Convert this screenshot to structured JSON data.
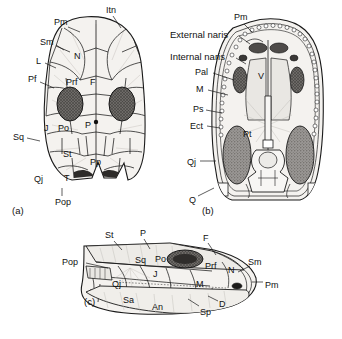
{
  "figure": {
    "background": "#ffffff",
    "ink": "#1a1a1a",
    "bone_fill": "#f2f0ec",
    "orbit_fill": "#6b6b6b",
    "vacuity_fill": "#8d8a86",
    "tooth_fill": "#ffffff"
  },
  "panels": [
    {
      "caption": "(a)",
      "view": "dorsal skull roof",
      "labels": [
        {
          "text": "Itn",
          "x": 106,
          "y": 6,
          "leader": [
            [
              113,
              16
            ],
            [
              121,
              28
            ]
          ]
        },
        {
          "text": "Pm",
          "x": 54,
          "y": 18,
          "leader": [
            [
              68,
              27
            ],
            [
              80,
              32
            ]
          ]
        },
        {
          "text": "Sm",
          "x": 40,
          "y": 38,
          "leader": [
            [
              56,
              45
            ],
            [
              64,
              50
            ]
          ]
        },
        {
          "text": "L",
          "x": 36,
          "y": 57,
          "leader": [
            [
              45,
              63
            ],
            [
              56,
              68
            ]
          ]
        },
        {
          "text": "Pf",
          "x": 28,
          "y": 75,
          "leader": [
            [
              40,
              82
            ],
            [
              54,
              88
            ]
          ]
        },
        {
          "text": "Prf",
          "x": 66,
          "y": 78,
          "leader": []
        },
        {
          "text": "N",
          "x": 74,
          "y": 52,
          "leader": []
        },
        {
          "text": "F",
          "x": 90,
          "y": 78,
          "leader": []
        },
        {
          "text": "Sq",
          "x": 13,
          "y": 133,
          "leader": [
            [
              27,
              138
            ],
            [
              40,
              141
            ]
          ]
        },
        {
          "text": "J",
          "x": 44,
          "y": 124,
          "leader": []
        },
        {
          "text": "Po",
          "x": 58,
          "y": 124,
          "leader": []
        },
        {
          "text": "P",
          "x": 85,
          "y": 121,
          "leader": []
        },
        {
          "text": "St",
          "x": 63,
          "y": 150,
          "leader": []
        },
        {
          "text": "Pp",
          "x": 90,
          "y": 158,
          "leader": []
        },
        {
          "text": "T",
          "x": 64,
          "y": 174,
          "leader": []
        },
        {
          "text": "Qj",
          "x": 34,
          "y": 175,
          "leader": []
        },
        {
          "text": "Pop",
          "x": 55,
          "y": 198,
          "leader": [
            [
              62,
              196
            ],
            [
              62,
              188
            ]
          ]
        }
      ]
    },
    {
      "caption": "(b)",
      "view": "palatal view",
      "labels": [
        {
          "text": "Pm",
          "x": 234,
          "y": 13,
          "leader": [
            [
              244,
              24
            ],
            [
              252,
              32
            ]
          ]
        },
        {
          "text": "External naris",
          "x": 170,
          "y": 30,
          "leader": [
            [
              239,
              36
            ],
            [
              250,
              44
            ]
          ]
        },
        {
          "text": "Internal naris",
          "x": 170,
          "y": 52,
          "leader": [
            [
              236,
              58
            ],
            [
              246,
              64
            ]
          ]
        },
        {
          "text": "Pal",
          "x": 195,
          "y": 68,
          "leader": [
            [
              213,
              73
            ],
            [
              234,
              80
            ]
          ]
        },
        {
          "text": "M",
          "x": 196,
          "y": 85,
          "leader": [
            [
              208,
              90
            ],
            [
              228,
              95
            ]
          ]
        },
        {
          "text": "Ps",
          "x": 193,
          "y": 105,
          "leader": [
            [
              206,
              110
            ],
            [
              222,
              113
            ]
          ]
        },
        {
          "text": "Ect",
          "x": 190,
          "y": 122,
          "leader": [
            [
              207,
              126
            ],
            [
              220,
              128
            ]
          ]
        },
        {
          "text": "V",
          "x": 258,
          "y": 72,
          "leader": []
        },
        {
          "text": "Pt",
          "x": 243,
          "y": 130,
          "leader": []
        },
        {
          "text": "Qj",
          "x": 187,
          "y": 158,
          "leader": [
            [
              200,
              161
            ],
            [
              216,
              161
            ]
          ]
        },
        {
          "text": "Q",
          "x": 189,
          "y": 196,
          "leader": [
            [
              198,
              196
            ],
            [
              214,
              188
            ]
          ]
        }
      ]
    },
    {
      "caption": "(c)",
      "view": "lateral view",
      "labels": [
        {
          "text": "St",
          "x": 105,
          "y": 231,
          "leader": [
            [
              114,
              241
            ],
            [
              122,
              250
            ]
          ]
        },
        {
          "text": "P",
          "x": 140,
          "y": 229,
          "leader": [
            [
              144,
              239
            ],
            [
              150,
              249
            ]
          ]
        },
        {
          "text": "F",
          "x": 203,
          "y": 234,
          "leader": [
            [
              208,
              243
            ],
            [
              216,
              255
            ]
          ]
        },
        {
          "text": "Sm",
          "x": 248,
          "y": 258,
          "leader": [
            [
              250,
              266
            ],
            [
              238,
              272
            ]
          ]
        },
        {
          "text": "Pop",
          "x": 62,
          "y": 258,
          "leader": [
            [
              86,
              263
            ],
            [
              108,
              268
            ]
          ]
        },
        {
          "text": "Sq",
          "x": 135,
          "y": 256,
          "leader": []
        },
        {
          "text": "Po",
          "x": 155,
          "y": 255,
          "leader": []
        },
        {
          "text": "J",
          "x": 153,
          "y": 270,
          "leader": []
        },
        {
          "text": "Prf",
          "x": 205,
          "y": 262,
          "leader": []
        },
        {
          "text": "N",
          "x": 228,
          "y": 266,
          "leader": []
        },
        {
          "text": "Pm",
          "x": 265,
          "y": 281,
          "leader": [
            [
              263,
              282
            ],
            [
              252,
              282
            ]
          ]
        },
        {
          "text": "Qj",
          "x": 112,
          "y": 280,
          "leader": []
        },
        {
          "text": "M",
          "x": 196,
          "y": 280,
          "leader": []
        },
        {
          "text": "Sa",
          "x": 123,
          "y": 296,
          "leader": []
        },
        {
          "text": "An",
          "x": 152,
          "y": 303,
          "leader": []
        },
        {
          "text": "Sp",
          "x": 200,
          "y": 308,
          "leader": [
            [
              199,
              306
            ],
            [
              188,
              299
            ]
          ]
        },
        {
          "text": "D",
          "x": 219,
          "y": 300,
          "leader": [
            [
              218,
              301
            ],
            [
              208,
              296
            ]
          ]
        }
      ]
    }
  ]
}
